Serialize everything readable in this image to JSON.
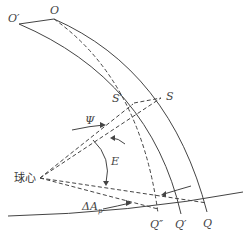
{
  "diagram": {
    "labels": {
      "O_prime": "O′",
      "O": "O",
      "S": "S",
      "S_prime": "S′",
      "psi": "Ψ",
      "E": "E",
      "center": "球心",
      "delta_A": "ΔA",
      "delta_A_sub": "p",
      "Q_double_prime": "Q″",
      "Q_prime": "Q′",
      "Q": "Q"
    },
    "colors": {
      "stroke": "#444444",
      "background": "#ffffff"
    }
  }
}
